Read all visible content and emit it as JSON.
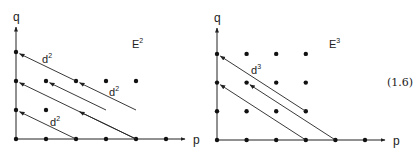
{
  "equation_number": "(1.6)",
  "diagrams": [
    {
      "id": "E2",
      "title": "E",
      "title_sup": "2",
      "x_axis_label": "p",
      "y_axis_label": "q",
      "origin": [
        16,
        139
      ],
      "dx": 30,
      "dy": 29,
      "axis_x_end": 185,
      "axis_y_end": 27,
      "points": [
        [
          0,
          0
        ],
        [
          1,
          0
        ],
        [
          2,
          0
        ],
        [
          3,
          0
        ],
        [
          4,
          0
        ],
        [
          5,
          0
        ],
        [
          0,
          1
        ],
        [
          1,
          1
        ],
        [
          0,
          2
        ],
        [
          1,
          2
        ],
        [
          2,
          2
        ],
        [
          3,
          2
        ],
        [
          4,
          2
        ],
        [
          0,
          3
        ]
      ],
      "arrows": [
        {
          "from": [
            2,
            0
          ],
          "to": [
            0,
            1
          ]
        },
        {
          "from": [
            4,
            0
          ],
          "to": [
            0,
            2
          ]
        },
        {
          "from": [
            3,
            1
          ],
          "to": [
            1,
            2
          ]
        },
        {
          "from": [
            4,
            1
          ],
          "to": [
            2,
            2
          ]
        },
        {
          "from": [
            2,
            2
          ],
          "to": [
            0,
            3
          ]
        },
        {
          "from": [
            4,
            0
          ],
          "to": [
            2,
            1
          ]
        }
      ],
      "arrow_labels": [
        {
          "text": "d",
          "sup": "2",
          "x": 42,
          "y": 63
        },
        {
          "text": "d",
          "sup": "2",
          "x": 109,
          "y": 96
        },
        {
          "text": "d",
          "sup": "2",
          "x": 50,
          "y": 126
        }
      ]
    },
    {
      "id": "E3",
      "title": "E",
      "title_sup": "3",
      "x_axis_label": "p",
      "y_axis_label": "q",
      "origin": [
        217,
        140
      ],
      "dx": 29.6,
      "dy": 28.7,
      "axis_x_end": 385,
      "axis_y_end": 28,
      "points": [
        [
          0,
          0
        ],
        [
          1,
          0
        ],
        [
          2,
          0
        ],
        [
          3,
          0
        ],
        [
          4,
          0
        ],
        [
          5,
          0
        ],
        [
          0,
          1
        ],
        [
          1,
          1
        ],
        [
          2,
          1
        ],
        [
          0,
          2
        ],
        [
          1,
          2
        ],
        [
          2,
          2
        ],
        [
          3,
          2
        ],
        [
          0,
          3
        ],
        [
          1,
          3
        ],
        [
          2,
          3
        ],
        [
          3,
          3
        ],
        [
          3,
          1
        ]
      ],
      "arrows": [
        {
          "from": [
            3,
            1
          ],
          "to": [
            0,
            3
          ]
        },
        {
          "from": [
            3,
            0
          ],
          "to": [
            0,
            2
          ]
        },
        {
          "from": [
            4,
            0
          ],
          "to": [
            1,
            2
          ]
        }
      ],
      "arrow_labels": [
        {
          "text": "d",
          "sup": "3",
          "x": 251,
          "y": 74
        }
      ]
    }
  ]
}
